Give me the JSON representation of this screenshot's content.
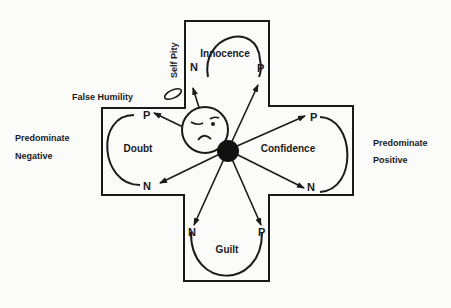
{
  "diagram": {
    "regions": {
      "top": {
        "label": "Innocence",
        "n": "N",
        "p": "P"
      },
      "left": {
        "label": "Doubt",
        "n": "N",
        "p": "P"
      },
      "right": {
        "label": "Confidence",
        "n": "N",
        "p": "P"
      },
      "bottom": {
        "label": "Guilt",
        "n": "N",
        "p": "P"
      }
    },
    "side_labels": {
      "left_line1": "Predominate",
      "left_line2": "Negative",
      "right_line1": "Predominate",
      "right_line2": "Positive"
    },
    "annotations": {
      "self_pity": "Self Pity",
      "false_humility": "False Humility"
    },
    "colors": {
      "ink": "#1a1a1a",
      "paper": "#fbfbfa"
    }
  }
}
